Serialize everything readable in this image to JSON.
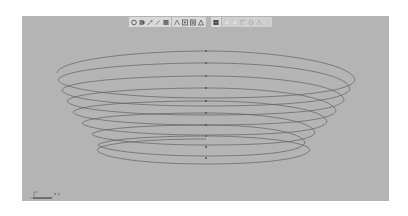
{
  "app": {
    "type": "3d-modeling-viewport",
    "view": "perspective"
  },
  "toolbar": {
    "groups": [
      {
        "icons": [
          "camera-select-icon",
          "camera-attributes-icon",
          "bookmark-icon",
          "image-plane-icon",
          "grid-icon"
        ]
      },
      {
        "icons": [
          "film-gate-icon",
          "resolution-gate-icon",
          "gate-mask-icon",
          "field-chart-icon"
        ]
      },
      {
        "icons": [
          "wireframe-icon"
        ]
      },
      {
        "icons": [
          "smooth-shade-icon",
          "textured-icon",
          "lights-icon",
          "shadows-icon",
          "isolate-icon",
          "xray-icon"
        ]
      }
    ]
  },
  "viewport": {
    "background_color": "#b4b4b4",
    "curve_color": "#5e5e5e",
    "object": "helix-spiral-curve",
    "ring_count": 10
  },
  "axis_gizmo": {
    "label": "x y"
  },
  "colors": {
    "background": "#ffffff",
    "viewport": "#b4b4b4",
    "toolbar": "#d9d9d9",
    "curve": "#5e5e5e"
  }
}
